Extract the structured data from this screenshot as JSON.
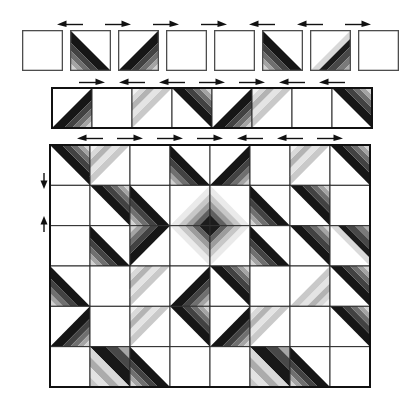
{
  "figure": {
    "background": "#ffffff",
    "grid_line_color": "#2b2b2b",
    "block_border_color": "#4d4d4d",
    "arrow_color": "#111111"
  },
  "palettes": {
    "dark": {
      "offsets": [
        0,
        12,
        20,
        27,
        33,
        40
      ],
      "colors": [
        "#161616",
        "#424242",
        "#6f6f6f",
        "#a4a4a4",
        "#d3d3d3"
      ]
    },
    "pale": {
      "offsets": [
        0,
        9,
        17,
        25,
        32,
        40
      ],
      "colors": [
        "#c9c9c9",
        "#e4e4e4",
        "#b3b3b3",
        "#d9d9d9",
        "#f1f1f1"
      ]
    },
    "rev": {
      "offsets": [
        0,
        8,
        16,
        25,
        33,
        40
      ],
      "colors": [
        "#d9d9d9",
        "#1a1a1a",
        "#474747",
        "#7a7a7a",
        "#aeaeae"
      ]
    },
    "med": {
      "offsets": [
        0,
        8,
        15,
        22,
        29,
        40
      ],
      "colors": [
        "#eaeaea",
        "#c7c7c7",
        "#9c9c9c",
        "#606060",
        "#1c1c1c"
      ]
    },
    "full": {
      "ne": {
        "offsets": [
          0,
          16,
          28,
          40
        ],
        "colors": [
          "#181818",
          "#484848",
          "#a6a6a6"
        ]
      },
      "sw": {
        "offsets": [
          0,
          10,
          20,
          30,
          40
        ],
        "colors": [
          "#d8d8d8",
          "#ababab",
          "#e3e3e3",
          "#c7c7c7"
        ]
      }
    }
  },
  "top_row": {
    "blocks": [
      "plain",
      "sw-dark",
      "se-dark",
      "plain",
      "plain",
      "sw-dark",
      "se-rev",
      "plain"
    ],
    "arrows": [
      "left",
      "right",
      "right",
      "right",
      "left",
      "left",
      "right"
    ]
  },
  "strip": {
    "cells": [
      "se-dark",
      "plain",
      "nw-pale",
      "ne-dark",
      "se-dark",
      "nw-pale",
      "plain",
      "ne-dark"
    ],
    "arrows": [
      "right",
      "left",
      "left",
      "right",
      "right",
      "left",
      "left"
    ]
  },
  "grid": {
    "rows": [
      [
        "ne-dark",
        "nw-pale",
        "plain",
        "sw-dark",
        "se-dark",
        "plain",
        "nw-pale",
        "ne-dark"
      ],
      [
        "plain",
        "ne-dark",
        "sw-dark",
        "se-med",
        "sw-med",
        "sw-dark",
        "ne-dark",
        "plain"
      ],
      [
        "plain",
        "sw-dark",
        "nw-dark",
        "ne-med",
        "nw-med",
        "sw-dark",
        "ne-dark",
        "ne-rev"
      ],
      [
        "sw-dark",
        "plain",
        "nw-pale",
        "se-dark",
        "ne-dark",
        "plain",
        "se-pale",
        "ne-dark"
      ],
      [
        "se-dark",
        "plain",
        "nw-pale",
        "ne-dark",
        "se-dark",
        "nw-pale",
        "plain",
        "ne-dark"
      ],
      [
        "plain",
        "full",
        "sw-dark",
        "plain",
        "plain",
        "full",
        "sw-dark",
        "plain"
      ]
    ],
    "arrows": [
      "left",
      "right",
      "right",
      "right",
      "left",
      "left",
      "right"
    ],
    "side_arrows": [
      "down",
      "up"
    ]
  }
}
